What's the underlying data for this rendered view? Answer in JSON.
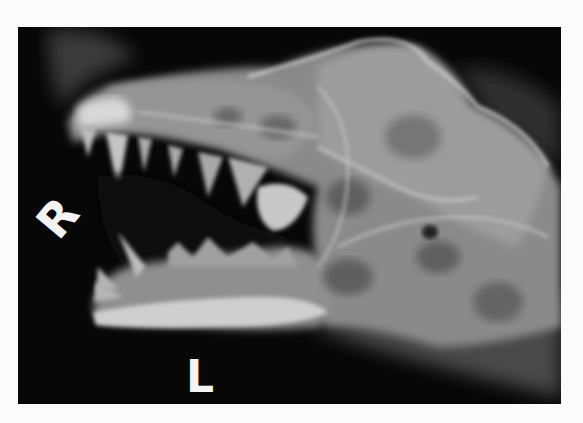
{
  "image": {
    "subject": "lateral skull radiograph",
    "background_color": "#070707",
    "page_color": "#fbfbfb",
    "bone_color": "#bdbdbd"
  },
  "markers": {
    "right": "R",
    "left": "L"
  }
}
